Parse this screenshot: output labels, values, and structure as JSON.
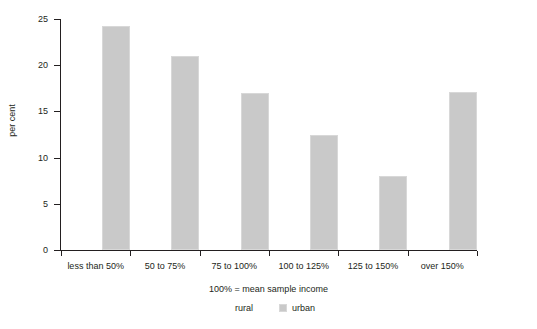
{
  "chart_data": {
    "type": "bar",
    "title": "",
    "xlabel": "100% = mean sample income",
    "ylabel": "per cent",
    "categories": [
      "less than 50%",
      "50 to 75%",
      "75 to 100%",
      "100 to 125%",
      "125 to 150%",
      "over 150%"
    ],
    "series": [
      {
        "name": "rural",
        "values": [
          null,
          null,
          null,
          null,
          null,
          null
        ],
        "color": "#ffffff"
      },
      {
        "name": "urban",
        "values": [
          24.2,
          21.0,
          17.0,
          12.4,
          8.0,
          17.1
        ],
        "color": "#c9c9c9"
      }
    ],
    "ylim": [
      0,
      25
    ],
    "yticks": [
      0,
      5,
      10,
      15,
      20,
      25
    ],
    "ytick_labels": [
      "0",
      "5",
      "10",
      "15",
      "20",
      "25"
    ],
    "grid": false,
    "legend_position": "bottom",
    "legend": [
      "rural",
      "urban"
    ]
  },
  "axis": {
    "y_title": "per cent",
    "x_title": "100% = mean sample income"
  },
  "legend": {
    "items": [
      {
        "label": "rural"
      },
      {
        "label": "urban"
      }
    ]
  }
}
